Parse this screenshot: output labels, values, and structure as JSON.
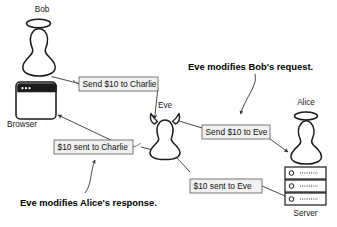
{
  "diagram": {
    "background_color": "#ffffff",
    "line_color": "#333333",
    "figure_stroke_color": "#1a1a1a",
    "box_fill_color": "#f2f2f2",
    "box_border_color": "#555555",
    "actors": [
      {
        "id": "bob",
        "label": "Bob",
        "icon": "pawn-halo-icon",
        "role": "client-user"
      },
      {
        "id": "browser",
        "label": "Browser",
        "icon": "browser-window-icon",
        "role": "client-app"
      },
      {
        "id": "eve",
        "label": "Eve",
        "icon": "pawn-horns-icon",
        "role": "attacker"
      },
      {
        "id": "alice",
        "label": "Alice",
        "icon": "pawn-halo-icon",
        "role": "server-user"
      },
      {
        "id": "server",
        "label": "Server",
        "icon": "server-rack-icon",
        "role": "server-host"
      }
    ],
    "messages": [
      {
        "id": "msg-request-original",
        "label": "Send $10 to Charlie",
        "from": "browser",
        "to": "eve"
      },
      {
        "id": "msg-request-modified",
        "label": "Send $10 to Eve",
        "from": "eve",
        "to": "alice"
      },
      {
        "id": "msg-response-original",
        "label": "$10 sent to Eve",
        "from": "server",
        "to": "eve"
      },
      {
        "id": "msg-response-modified",
        "label": "$10 sent to Charlie",
        "from": "eve",
        "to": "browser"
      }
    ],
    "annotations": [
      {
        "id": "annot-request",
        "text": "Eve modifies Bob's request.",
        "targets": "msg-request-modified"
      },
      {
        "id": "annot-response",
        "text": "Eve modifies Alice's response.",
        "targets": "msg-response-modified"
      }
    ]
  }
}
